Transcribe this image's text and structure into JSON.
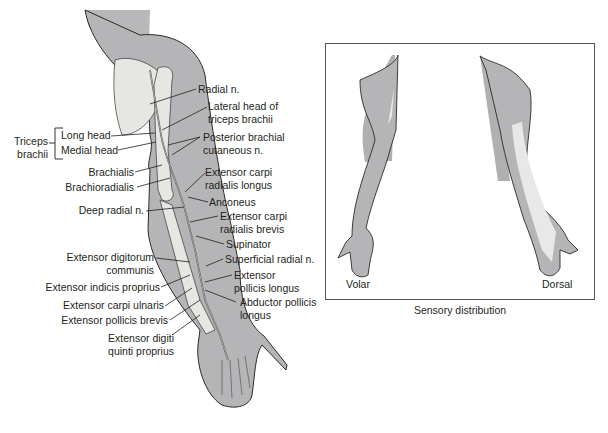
{
  "figure": {
    "left_panel": {
      "name": "Radial nerve course, posterior arm and forearm",
      "group_label": {
        "text_line1": "Triceps",
        "text_line2": "brachii"
      },
      "labels_left": [
        {
          "id": "long-head",
          "text": "Long head"
        },
        {
          "id": "medial-head",
          "text": "Medial head"
        },
        {
          "id": "brachialis",
          "text": "Brachialis"
        },
        {
          "id": "brachioradialis",
          "text": "Brachioradialis"
        },
        {
          "id": "deep-radial-n",
          "text": "Deep radial n."
        },
        {
          "id": "ext-digitorum-communis-1",
          "text": "Extensor digitorum"
        },
        {
          "id": "ext-digitorum-communis-2",
          "text": "communis"
        },
        {
          "id": "ext-indicis-proprius",
          "text": "Extensor indicis proprius"
        },
        {
          "id": "ext-carpi-ulnaris",
          "text": "Extensor carpi ulnaris"
        },
        {
          "id": "ext-pollicis-brevis",
          "text": "Extensor pollicis brevis"
        },
        {
          "id": "ext-digiti-quinti-1",
          "text": "Extensor digiti"
        },
        {
          "id": "ext-digiti-quinti-2",
          "text": "quinti proprius"
        }
      ],
      "labels_right": [
        {
          "id": "radial-n",
          "text": "Radial n."
        },
        {
          "id": "lateral-head-1",
          "text": "Lateral head of"
        },
        {
          "id": "lateral-head-2",
          "text": "triceps brachii"
        },
        {
          "id": "post-brachial-1",
          "text": "Posterior brachial"
        },
        {
          "id": "post-brachial-2",
          "text": "cutaneous n."
        },
        {
          "id": "ecrl-1",
          "text": "Extensor carpi"
        },
        {
          "id": "ecrl-2",
          "text": "radialis longus"
        },
        {
          "id": "anconeus",
          "text": "Anconeus"
        },
        {
          "id": "ecrb-1",
          "text": "Extensor carpi"
        },
        {
          "id": "ecrb-2",
          "text": "radialis brevis"
        },
        {
          "id": "supinator",
          "text": "Supinator"
        },
        {
          "id": "superficial-radial-n",
          "text": "Superficial radial n."
        },
        {
          "id": "epl-1",
          "text": "Extensor"
        },
        {
          "id": "epl-2",
          "text": "pollicis longus"
        },
        {
          "id": "apl-1",
          "text": "Abductor pollicis"
        },
        {
          "id": "apl-2",
          "text": "longus"
        }
      ]
    },
    "right_panel": {
      "volar_label": "Volar",
      "dorsal_label": "Dorsal",
      "caption": "Sensory distribution"
    },
    "colors": {
      "skin": "#b5b5b7",
      "bone": "#e6e6e3",
      "outline": "#2a2a2a",
      "sensory_area": "#e8e8e6"
    }
  }
}
